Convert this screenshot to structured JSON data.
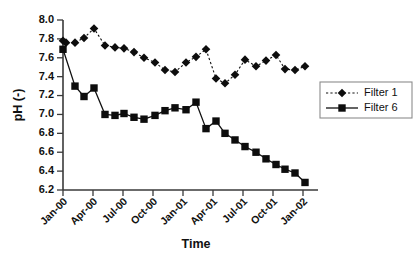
{
  "chart_data": {
    "type": "line",
    "title": "",
    "xlabel": "Time",
    "ylabel": "pH (-)",
    "ylim": [
      6.2,
      8.0
    ],
    "ytick_step": 0.2,
    "yticks": [
      "6.2",
      "6.4",
      "6.6",
      "6.8",
      "7.0",
      "7.2",
      "7.4",
      "7.6",
      "7.8",
      "8.0"
    ],
    "xticks": [
      "Jan-00",
      "Apr-00",
      "Jul-00",
      "Oct-00",
      "Jan-01",
      "Apr-01",
      "Jul-01",
      "Oct-01",
      "Jan-02"
    ],
    "xtick_months": [
      0,
      3,
      6,
      9,
      12,
      15,
      18,
      21,
      24
    ],
    "xlim_months": [
      0,
      25.5
    ],
    "grid": false,
    "legend_position": "right-middle",
    "series": [
      {
        "name": "Filter 1",
        "marker": "diamond",
        "line_style": "dotted",
        "color": "#0d0d0d",
        "x": [
          0.0,
          0.3,
          1.2,
          2.1,
          3.1,
          4.2,
          5.2,
          6.1,
          7.1,
          8.1,
          9.2,
          10.2,
          11.2,
          12.3,
          13.3,
          14.3,
          15.3,
          16.2,
          17.2,
          18.2,
          19.3,
          20.3,
          21.3,
          22.2,
          23.2,
          24.2
        ],
        "values": [
          7.78,
          7.76,
          7.76,
          7.81,
          7.91,
          7.73,
          7.71,
          7.7,
          7.66,
          7.6,
          7.55,
          7.47,
          7.45,
          7.55,
          7.61,
          7.69,
          7.38,
          7.33,
          7.42,
          7.58,
          7.51,
          7.57,
          7.63,
          7.48,
          7.47,
          7.51
        ]
      },
      {
        "name": "Filter 6",
        "marker": "square",
        "line_style": "solid",
        "color": "#0d0d0d",
        "x": [
          0.0,
          1.2,
          2.1,
          3.1,
          4.2,
          5.2,
          6.1,
          7.1,
          8.1,
          9.2,
          10.2,
          11.2,
          12.3,
          13.3,
          14.3,
          15.3,
          16.2,
          17.2,
          18.2,
          19.3,
          20.3,
          21.3,
          22.2,
          23.2,
          24.2
        ],
        "values": [
          7.69,
          7.3,
          7.19,
          7.28,
          7.0,
          6.99,
          7.01,
          6.97,
          6.95,
          6.99,
          7.04,
          7.07,
          7.05,
          7.13,
          6.85,
          6.93,
          6.8,
          6.73,
          6.66,
          6.6,
          6.53,
          6.47,
          6.42,
          6.38,
          6.28
        ]
      }
    ]
  },
  "legend": {
    "entries": [
      {
        "label": "Filter 1"
      },
      {
        "label": "Filter 6"
      }
    ]
  }
}
